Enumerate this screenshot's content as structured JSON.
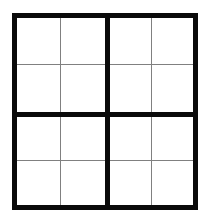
{
  "figure": {
    "name": "sudoku-grid",
    "kind": "4x4 grid",
    "background_color": "#ffffff",
    "thick_line_color": "#0a0a0a",
    "thin_line_color": "#808080",
    "cell_fill_color": "#ffffff",
    "rows": 4,
    "columns": 4,
    "block_rows": 2,
    "block_columns": 2
  },
  "grid": {
    "cells": [
      [
        "",
        "",
        "",
        ""
      ],
      [
        "",
        "",
        "",
        ""
      ],
      [
        "",
        "",
        "",
        ""
      ],
      [
        "",
        "",
        "",
        ""
      ]
    ]
  },
  "blocks": [
    {
      "id": "block-top-left",
      "cells": [
        {
          "name": "cell-r1c1",
          "value": ""
        },
        {
          "name": "cell-r1c2",
          "value": ""
        },
        {
          "name": "cell-r2c1",
          "value": ""
        },
        {
          "name": "cell-r2c2",
          "value": ""
        }
      ]
    },
    {
      "id": "block-top-right",
      "cells": [
        {
          "name": "cell-r1c3",
          "value": ""
        },
        {
          "name": "cell-r1c4",
          "value": ""
        },
        {
          "name": "cell-r2c3",
          "value": ""
        },
        {
          "name": "cell-r2c4",
          "value": ""
        }
      ]
    },
    {
      "id": "block-bottom-left",
      "cells": [
        {
          "name": "cell-r3c1",
          "value": ""
        },
        {
          "name": "cell-r3c2",
          "value": ""
        },
        {
          "name": "cell-r4c1",
          "value": ""
        },
        {
          "name": "cell-r4c2",
          "value": ""
        }
      ]
    },
    {
      "id": "block-bottom-right",
      "cells": [
        {
          "name": "cell-r3c3",
          "value": ""
        },
        {
          "name": "cell-r3c4",
          "value": ""
        },
        {
          "name": "cell-r4c3",
          "value": ""
        },
        {
          "name": "cell-r4c4",
          "value": ""
        }
      ]
    }
  ]
}
